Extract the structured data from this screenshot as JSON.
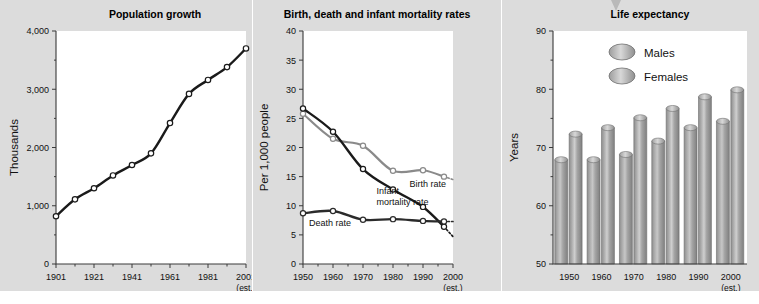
{
  "page": {
    "background_color": "#ffffff",
    "panel_color": "#dcdcdc",
    "plot_color": "#ffffff",
    "arrow_icon": "down-arrow-marker"
  },
  "chart_data": [
    {
      "type": "line",
      "id": "population-growth",
      "title": "Population growth",
      "xlabel": "",
      "ylabel": "Thousands",
      "xlim": [
        1901,
        2001
      ],
      "ylim": [
        0,
        4000
      ],
      "yticks": [
        0,
        1000,
        2000,
        3000,
        4000
      ],
      "yticklabels": [
        "0",
        "1,000",
        "2,000",
        "3,000",
        "4,000"
      ],
      "xticks": [
        1901,
        1921,
        1941,
        1961,
        1981,
        2001
      ],
      "xticklabels": [
        "1901",
        "1921",
        "1941",
        "1961",
        "1981",
        "2001"
      ],
      "x_note": "(est.)",
      "x_note_at": 2001,
      "grid": false,
      "legend": "none",
      "marker": "open-circle",
      "series": [
        {
          "name": "Population",
          "color": "#1a1a1a",
          "x": [
            1901,
            1911,
            1921,
            1931,
            1941,
            1951,
            1961,
            1971,
            1981,
            1991,
            2001
          ],
          "values": [
            820,
            1110,
            1300,
            1520,
            1700,
            1900,
            2420,
            2920,
            3160,
            3380,
            3700
          ]
        }
      ]
    },
    {
      "type": "line",
      "id": "birth-death-infant-mortality",
      "title": "Birth, death and infant mortality rates",
      "xlabel": "",
      "ylabel": "Per 1,000 people",
      "xlim": [
        1950,
        2000
      ],
      "ylim": [
        0,
        40
      ],
      "yticks": [
        0,
        5,
        10,
        15,
        20,
        25,
        30,
        35,
        40
      ],
      "yticklabels": [
        "0",
        "5",
        "10",
        "15",
        "20",
        "25",
        "30",
        "35",
        "40"
      ],
      "xticks": [
        1950,
        1960,
        1970,
        1980,
        1990,
        2000
      ],
      "xticklabels": [
        "1950",
        "1960",
        "1970",
        "1980",
        "1990",
        "2000"
      ],
      "x_note": "(est.)",
      "x_note_at": 2000,
      "grid": false,
      "legend": "inline-annotations",
      "marker": "open-circle",
      "series": [
        {
          "name": "Birth rate",
          "color": "#8a8a8a",
          "x": [
            1950,
            1960,
            1970,
            1980,
            1990,
            1997
          ],
          "values": [
            25.8,
            21.5,
            20.3,
            16.0,
            16.1,
            15.0
          ],
          "dashed_tail": {
            "x": [
              1997,
              2000
            ],
            "values": [
              15.0,
              14.5
            ]
          },
          "annotation": "Birth rate",
          "annotation_at": {
            "x": 1985.5,
            "y": 13.3
          }
        },
        {
          "name": "Infant mortality rate",
          "color": "#1a1a1a",
          "x": [
            1950,
            1960,
            1970,
            1980,
            1990,
            1997
          ],
          "values": [
            26.7,
            22.7,
            16.3,
            12.8,
            9.8,
            6.4
          ],
          "dashed_tail": {
            "x": [
              1997,
              2000
            ],
            "values": [
              6.4,
              4.7
            ]
          },
          "annotation": "Infant\nmortality rate",
          "annotation_at": {
            "x": 1974.5,
            "y": 12.0
          }
        },
        {
          "name": "Death rate",
          "color": "#2b2b2b",
          "x": [
            1950,
            1960,
            1970,
            1980,
            1990,
            1997
          ],
          "values": [
            8.7,
            9.1,
            7.6,
            7.7,
            7.4,
            7.3
          ],
          "dashed_tail": {
            "x": [
              1997,
              2000
            ],
            "values": [
              7.3,
              7.3
            ]
          },
          "annotation": "Death rate",
          "annotation_at": {
            "x": 1952.0,
            "y": 6.6
          }
        }
      ]
    },
    {
      "type": "bar",
      "id": "life-expectancy",
      "title": "Life expectancy",
      "xlabel": "",
      "ylabel": "Years",
      "ylim": [
        50,
        90
      ],
      "yticks": [
        50,
        60,
        70,
        80,
        90
      ],
      "yticklabels": [
        "50",
        "60",
        "70",
        "80",
        "90"
      ],
      "categories": [
        "1950",
        "1960",
        "1970",
        "1980",
        "1990",
        "2000"
      ],
      "x_note": "(est.)",
      "x_note_at": "2000",
      "grid": false,
      "legend": {
        "position": "inside-top-center",
        "entries": [
          {
            "label": "Males",
            "color": "#9a9a9a",
            "marker": "cylinder-ellipse"
          },
          {
            "label": "Females",
            "color": "#b3b3b3",
            "marker": "cylinder-ellipse"
          }
        ]
      },
      "series": [
        {
          "name": "Males",
          "color": "#9a9a9a",
          "values": [
            67.9,
            67.9,
            68.8,
            71.1,
            73.4,
            74.5
          ]
        },
        {
          "name": "Females",
          "color": "#b0b0b0",
          "values": [
            72.3,
            73.4,
            75.1,
            76.7,
            78.7,
            79.9
          ]
        }
      ]
    }
  ]
}
